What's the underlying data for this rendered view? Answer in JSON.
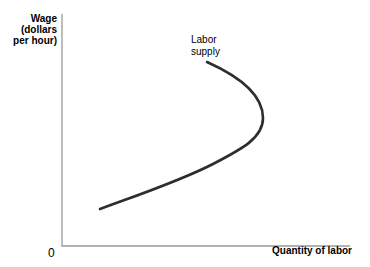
{
  "figure": {
    "y_axis_label_lines": [
      "Wage",
      "(dollars",
      "per hour)"
    ],
    "curve_label_lines": [
      "Labor",
      "supply"
    ],
    "x_axis_label": "Quantity of labor",
    "origin_label": "0"
  },
  "colors": {
    "background": "#ffffff",
    "axis": "#9a9a9a",
    "curve": "#2d2d2d",
    "text": "#000000"
  },
  "svg": {
    "axes_points": "62,14 62,246 350,246",
    "curve_path": "M 100 209 C 138 195 180 181 213 164 C 242 149 263 138 263 118 C 263 98 245 79 207 62"
  },
  "chart_data": {
    "type": "line",
    "title": "",
    "xlabel": "Quantity of labor",
    "ylabel": "Wage (dollars per hour)",
    "legend": [
      "Labor supply"
    ],
    "legend_position": "annotation at top end of curve",
    "grid": false,
    "axis_numeric_ticks": false,
    "origin_label": "0",
    "series": [
      {
        "name": "Labor supply",
        "points_fraction_of_axes": [
          {
            "quantity": 0.13,
            "wage": 0.16
          },
          {
            "quantity": 0.34,
            "wage": 0.25
          },
          {
            "quantity": 0.52,
            "wage": 0.35
          },
          {
            "quantity": 0.65,
            "wage": 0.46
          },
          {
            "quantity": 0.7,
            "wage": 0.55
          },
          {
            "quantity": 0.65,
            "wage": 0.68
          },
          {
            "quantity": 0.5,
            "wage": 0.79
          }
        ]
      }
    ]
  }
}
